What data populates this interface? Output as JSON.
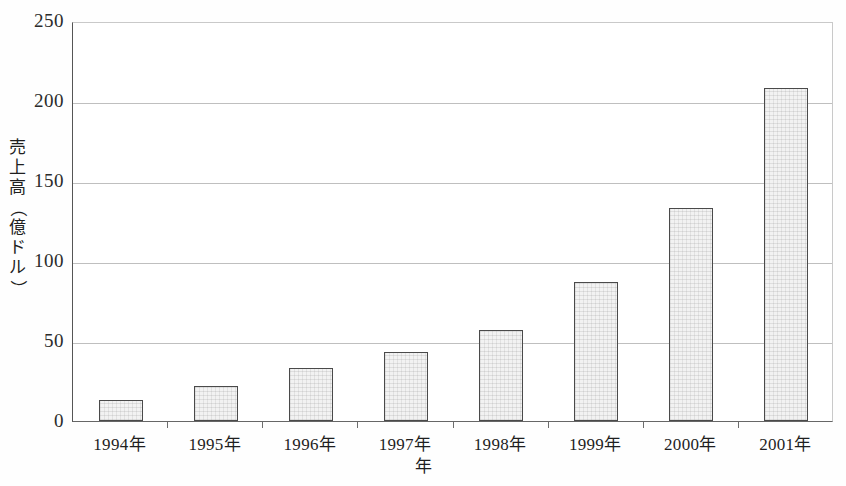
{
  "chart_data": {
    "type": "bar",
    "title": "",
    "xlabel": "年",
    "ylabel": "売上高（億ドル）",
    "ylabel_chars": [
      "売",
      "上",
      "高",
      "（",
      "億",
      "ド",
      "ル",
      "）"
    ],
    "categories": [
      "1994年",
      "1995年",
      "1996年",
      "1997年",
      "1998年",
      "1999年",
      "2000年",
      "2001年"
    ],
    "values": [
      13,
      22,
      33,
      43,
      57,
      87,
      133,
      208
    ],
    "ylim": [
      0,
      250
    ],
    "ytick_labels": [
      "0",
      "50",
      "100",
      "150",
      "200",
      "250"
    ],
    "ytick_values": [
      0,
      50,
      100,
      150,
      200,
      250
    ],
    "grid": true,
    "legend": "none",
    "colors": {
      "bar_fill": "#f2f2f2",
      "bar_outline": "#4a4a4a",
      "gridline": "#8a8a8a",
      "axis": "#555555",
      "text": "#1f1f1f",
      "background": "#fefefe"
    }
  }
}
